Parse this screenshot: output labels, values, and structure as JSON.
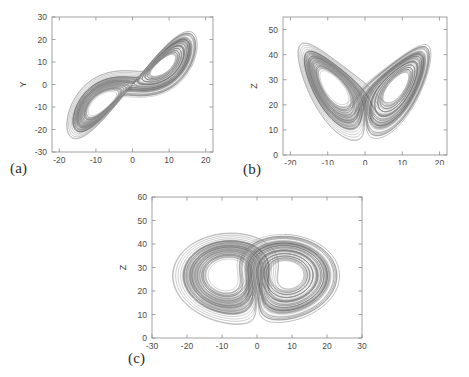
{
  "figure": {
    "background_color": "#ffffff",
    "axis_color": "#8a8a8a",
    "trajectory_color": "#808080",
    "label_color": "#3a3a3a"
  },
  "panels": {
    "a": {
      "label": "(a)",
      "xlabel": "X",
      "ylabel": "Y"
    },
    "b": {
      "label": "(b)",
      "xlabel": "X",
      "ylabel": "Z"
    },
    "c": {
      "label": "(c)",
      "xlabel": "Y",
      "ylabel": "Z"
    }
  },
  "chart_data": [
    {
      "id": "a",
      "type": "line",
      "title": "",
      "panel_label": "(a)",
      "xlabel": "X",
      "ylabel": "Y",
      "xlim": [
        -22,
        22
      ],
      "ylim": [
        -30,
        30
      ],
      "xticks": [
        -20,
        -10,
        0,
        10,
        20
      ],
      "yticks": [
        -30,
        -20,
        -10,
        0,
        10,
        20,
        30
      ],
      "grid": false,
      "legend": "none",
      "description": "Lorenz attractor projection onto the X-Y plane; two lobes centered near (-8.5,-8.5) and (8.5,8.5) forming a tilted figure-eight.",
      "projection": [
        "x",
        "y"
      ],
      "series": [
        {
          "name": "trajectory",
          "color": "#808080",
          "lobe_centers": [
            [
              -8.49,
              -8.49
            ],
            [
              8.49,
              8.49
            ]
          ],
          "x_range": [
            -19.5,
            20.5
          ],
          "y_range": [
            -27,
            27
          ]
        }
      ]
    },
    {
      "id": "b",
      "type": "line",
      "title": "",
      "panel_label": "(b)",
      "xlabel": "X",
      "ylabel": "Z",
      "xlim": [
        -22,
        22
      ],
      "ylim": [
        0,
        55
      ],
      "xticks": [
        -20,
        -10,
        0,
        10,
        20
      ],
      "yticks": [
        0,
        10,
        20,
        30,
        40,
        50
      ],
      "grid": false,
      "legend": "none",
      "description": "Lorenz attractor projection onto the X-Z plane; classic butterfly with two wings centered near (-8.5,27) and (8.5,27).",
      "projection": [
        "x",
        "z"
      ],
      "series": [
        {
          "name": "trajectory",
          "color": "#808080",
          "lobe_centers": [
            [
              -8.49,
              27.0
            ],
            [
              8.49,
              27.0
            ]
          ],
          "x_range": [
            -19.5,
            20.5
          ],
          "y_range": [
            1,
            48
          ]
        }
      ]
    },
    {
      "id": "c",
      "type": "line",
      "title": "",
      "panel_label": "(c)",
      "xlabel": "Y",
      "ylabel": "Z",
      "xlim": [
        -30,
        30
      ],
      "ylim": [
        0,
        60
      ],
      "xticks": [
        -30,
        -20,
        -10,
        0,
        10,
        20,
        30
      ],
      "yticks": [
        0,
        10,
        20,
        30,
        40,
        50,
        60
      ],
      "grid": false,
      "legend": "none",
      "description": "Lorenz attractor projection onto the Y-Z plane; two nested-ring lobes with hollow centers near (-9,26) and (9,26).",
      "projection": [
        "y",
        "z"
      ],
      "series": [
        {
          "name": "trajectory",
          "color": "#808080",
          "lobe_centers": [
            [
              -9.0,
              26.0
            ],
            [
              9.0,
              26.0
            ]
          ],
          "x_range": [
            -27,
            27
          ],
          "y_range": [
            1,
            48
          ]
        }
      ]
    }
  ],
  "system": {
    "name": "Lorenz",
    "sigma": 10,
    "rho": 28,
    "beta": 2.6667,
    "initial_state": [
      1.0,
      1.0,
      20.0
    ],
    "dt": 0.0035,
    "steps": 26000
  }
}
